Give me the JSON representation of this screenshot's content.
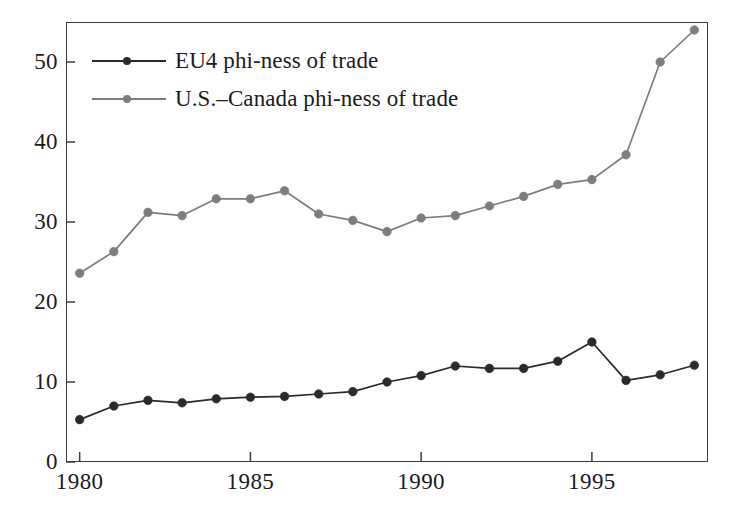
{
  "chart_data": {
    "type": "line",
    "title": "",
    "xlabel": "",
    "ylabel": "",
    "xlim": [
      1979.6,
      1998.4
    ],
    "ylim": [
      0,
      55
    ],
    "grid": false,
    "legend_position": "top-left",
    "x": [
      1980,
      1981,
      1982,
      1983,
      1984,
      1985,
      1986,
      1987,
      1988,
      1989,
      1990,
      1991,
      1992,
      1993,
      1994,
      1995,
      1996,
      1997,
      1998
    ],
    "xticks": [
      1980,
      1985,
      1990,
      1995
    ],
    "yticks": [
      0,
      10,
      20,
      30,
      40,
      50
    ],
    "series": [
      {
        "name": "EU4 phi-ness of trade",
        "color": "#2a2a2a",
        "marker": "circle",
        "values": [
          5.3,
          7.0,
          7.7,
          7.4,
          7.9,
          8.1,
          8.2,
          8.5,
          8.8,
          10.0,
          10.8,
          12.0,
          11.7,
          11.7,
          12.6,
          15.0,
          10.2,
          10.9,
          12.1
        ]
      },
      {
        "name": "U.S.–Canada phi-ness of trade",
        "color": "#7d7d7d",
        "marker": "circle",
        "values": [
          23.6,
          26.3,
          31.2,
          30.8,
          32.9,
          32.9,
          33.9,
          31.0,
          30.2,
          28.8,
          30.5,
          30.8,
          32.0,
          33.2,
          34.7,
          35.3,
          38.4,
          50.0,
          54.0
        ]
      }
    ]
  },
  "legend": {
    "items": [
      {
        "label": "EU4 phi-ness of trade",
        "color": "#2a2a2a"
      },
      {
        "label": "U.S.–Canada phi-ness of trade",
        "color": "#7d7d7d"
      }
    ]
  },
  "axes": {
    "y_tick_labels": [
      "50",
      "40",
      "30",
      "20",
      "10",
      "0"
    ],
    "x_tick_labels": [
      "1980",
      "1985",
      "1990",
      "1995"
    ]
  }
}
